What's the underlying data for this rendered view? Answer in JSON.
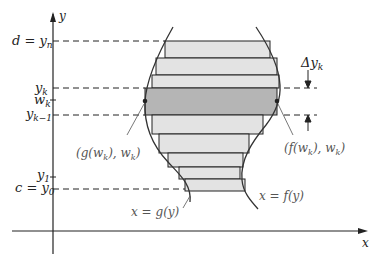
{
  "diagram": {
    "axes": {
      "x_label": "x",
      "y_label": "y"
    },
    "y_tick_labels": [
      {
        "id": "d",
        "text": "d = y",
        "sub": "n"
      },
      {
        "id": "yk",
        "text": "y",
        "sub": "k"
      },
      {
        "id": "wk",
        "text": "w",
        "sub": "k"
      },
      {
        "id": "yk1",
        "text": "y",
        "sub": "k−1"
      },
      {
        "id": "y1",
        "text": "y",
        "sub": "1"
      },
      {
        "id": "c",
        "text": "c = y",
        "sub": "0"
      }
    ],
    "annotations": {
      "delta": {
        "text": "Δy",
        "sub": "k"
      },
      "left_point": {
        "pre": "(g(w",
        "sub1": "k",
        "mid": "), w",
        "sub2": "k",
        "post": ")"
      },
      "right_point": {
        "pre": "(f(w",
        "sub1": "k",
        "mid": "), w",
        "sub2": "k",
        "post": ")"
      },
      "left_curve": "x = g(y)",
      "right_curve": "x = f(y)"
    },
    "colors": {
      "rect_fill": "#e3e3e3",
      "rect_highlight_fill": "#b5b5b5",
      "stroke": "#222222",
      "label_gray": "#555555"
    }
  }
}
